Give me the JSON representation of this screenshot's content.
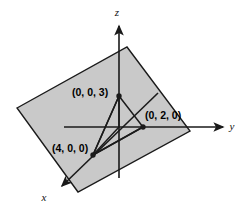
{
  "figure": {
    "background_color": "#ffffff",
    "plane": {
      "name": "shaded-plane",
      "fill_color": "#c9c9c9",
      "stroke_color": "#1a1a1a",
      "corners": [
        {
          "x": 17,
          "y": 108
        },
        {
          "x": 127,
          "y": 47
        },
        {
          "x": 190,
          "y": 131
        },
        {
          "x": 78,
          "y": 192
        }
      ]
    },
    "axes": [
      {
        "name": "z-axis",
        "label": "z",
        "label_x": 117,
        "label_y": 16,
        "from": {
          "x": 119,
          "y": 178
        },
        "to": {
          "x": 119,
          "y": 26
        },
        "arrow": "end"
      },
      {
        "name": "y-axis",
        "label": "y",
        "label_x": 232,
        "label_y": 130,
        "from": {
          "x": 64,
          "y": 127
        },
        "to": {
          "x": 223,
          "y": 127
        },
        "arrow": "end"
      },
      {
        "name": "x-axis",
        "label": "x",
        "label_x": 44,
        "label_y": 201,
        "from": {
          "x": 158,
          "y": 93
        },
        "to": {
          "x": 62,
          "y": 186
        },
        "arrow": "end"
      }
    ],
    "origin": {
      "x": 119,
      "y": 127
    },
    "points": [
      {
        "name": "point-z-intercept",
        "label": "(0, 0, 3)",
        "coords": [
          0,
          0,
          3
        ],
        "x": 119,
        "y": 96,
        "label_x": 72,
        "label_y": 96,
        "label_anchor": "start"
      },
      {
        "name": "point-y-intercept",
        "label": "(0, 2, 0)",
        "coords": [
          0,
          2,
          0
        ],
        "x": 143,
        "y": 127,
        "label_x": 145,
        "label_y": 119,
        "label_anchor": "start"
      },
      {
        "name": "point-x-intercept",
        "label": "(4, 0, 0)",
        "coords": [
          4,
          0,
          0
        ],
        "x": 93,
        "y": 155,
        "label_x": 52,
        "label_y": 152,
        "label_anchor": "start"
      }
    ],
    "triangle": {
      "name": "intercept-triangle",
      "stroke_color": "#1a1a1a",
      "vertices": [
        {
          "x": 119,
          "y": 96
        },
        {
          "x": 143,
          "y": 127
        },
        {
          "x": 93,
          "y": 155
        }
      ]
    },
    "colors": {
      "plane_fill": "#c9c9c9",
      "stroke": "#1a1a1a",
      "text": "#000000",
      "background": "#ffffff"
    }
  }
}
